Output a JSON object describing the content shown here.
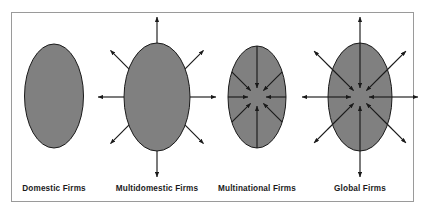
{
  "figure": {
    "frame": {
      "x": 11,
      "y": 12,
      "width": 403,
      "height": 190,
      "border_color": "#9a9a9a",
      "background_color": "#ffffff"
    },
    "style": {
      "ellipse_fill": "#808080",
      "ellipse_stroke": "#1a1a1a",
      "arrow_color": "#1a1a1a",
      "label_color": "#1b1b1b",
      "page_background": "#ffffff"
    }
  },
  "panels": [
    {
      "id": "domestic",
      "label": "Domestic Firms",
      "label_x": 54,
      "label_y": 191,
      "ellipse": {
        "cx": 54,
        "cy": 96,
        "rx": 29.5,
        "ry": 52
      },
      "arrows": {
        "outward": false,
        "inward": false,
        "count": 0
      },
      "description": "Solid ellipse with no arrows"
    },
    {
      "id": "multidomestic",
      "label": "Multidomestic Firms",
      "label_x": 157,
      "label_y": 191,
      "ellipse": {
        "cx": 157,
        "cy": 97,
        "rx": 33,
        "ry": 54
      },
      "arrows": {
        "outward": true,
        "inward": false,
        "count": 8
      },
      "outward_extent": 26,
      "description": "Ellipse with eight arrows radiating outward"
    },
    {
      "id": "multinational",
      "label": "Multinational Firms",
      "label_x": 257,
      "label_y": 191,
      "ellipse": {
        "cx": 257,
        "cy": 97,
        "rx": 29,
        "ry": 51
      },
      "arrows": {
        "outward": false,
        "inward": true,
        "count": 8
      },
      "inward_gap": 9,
      "description": "Ellipse with eight arrows pointing inward to the centre"
    },
    {
      "id": "global",
      "label": "Global Firms",
      "label_x": 360,
      "label_y": 191,
      "ellipse": {
        "cx": 360,
        "cy": 97,
        "rx": 32,
        "ry": 54
      },
      "arrows": {
        "outward": true,
        "inward": true,
        "count": 16
      },
      "outward_extent": 26,
      "inward_gap": 9,
      "description": "Ellipse with eight arrows pointing inward and eight radiating outward"
    }
  ],
  "arrow_directions": [
    {
      "name": "up",
      "dx": 0,
      "dy": -1
    },
    {
      "name": "up-right",
      "dx": 0.7071,
      "dy": -0.7071
    },
    {
      "name": "right",
      "dx": 1,
      "dy": 0
    },
    {
      "name": "down-right",
      "dx": 0.7071,
      "dy": 0.7071
    },
    {
      "name": "down",
      "dx": 0,
      "dy": 1
    },
    {
      "name": "down-left",
      "dx": -0.7071,
      "dy": 0.7071
    },
    {
      "name": "left",
      "dx": -1,
      "dy": 0
    },
    {
      "name": "up-left",
      "dx": -0.7071,
      "dy": -0.7071
    }
  ]
}
